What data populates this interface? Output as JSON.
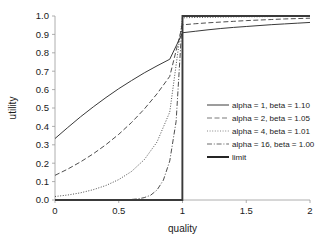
{
  "chart_data": {
    "type": "line",
    "title": "",
    "xlabel": "quality",
    "ylabel": "utility",
    "xlim": [
      0,
      2
    ],
    "ylim": [
      0,
      1
    ],
    "grid": false,
    "legend_position": "center-right",
    "xticks": [
      "0",
      "0.5",
      "1",
      "1.5",
      "2"
    ],
    "xtick_values": [
      0,
      0.5,
      1,
      1.5,
      2
    ],
    "yticks": [
      "0.0",
      "0.1",
      "0.2",
      "0.3",
      "0.4",
      "0.5",
      "0.6",
      "0.7",
      "0.8",
      "0.9",
      "1.0"
    ],
    "ytick_values": [
      0,
      0.1,
      0.2,
      0.3,
      0.4,
      0.5,
      0.6,
      0.7,
      0.8,
      0.9,
      1.0
    ],
    "series": [
      {
        "name": "alpha = 1, beta = 1.10",
        "alpha": 1,
        "beta": 1.1,
        "dash": "solid",
        "color": "#3a3a3a",
        "width": 1.0,
        "x": [
          0,
          0.1,
          0.2,
          0.3,
          0.4,
          0.5,
          0.6,
          0.7,
          0.8,
          0.9,
          1.0,
          1.1,
          1.2,
          1.3,
          1.4,
          1.5,
          1.6,
          1.7,
          1.8,
          1.9,
          2.0
        ],
        "values": [
          0.334,
          0.394,
          0.452,
          0.506,
          0.557,
          0.605,
          0.649,
          0.691,
          0.729,
          0.765,
          0.909,
          0.917,
          0.925,
          0.932,
          0.938,
          0.943,
          0.948,
          0.953,
          0.957,
          0.961,
          0.965
        ]
      },
      {
        "name": "alpha = 2, beta = 1.05",
        "alpha": 2,
        "beta": 1.05,
        "dash": "dashed",
        "color": "#6a6a6a",
        "width": 0.9,
        "x": [
          0,
          0.1,
          0.2,
          0.3,
          0.4,
          0.5,
          0.6,
          0.7,
          0.8,
          0.9,
          1.0,
          1.1,
          1.2,
          1.3,
          1.4,
          1.5,
          1.6,
          1.7,
          1.8,
          1.9,
          2.0
        ],
        "values": [
          0.134,
          0.168,
          0.207,
          0.251,
          0.301,
          0.357,
          0.421,
          0.494,
          0.577,
          0.672,
          0.952,
          0.958,
          0.963,
          0.967,
          0.971,
          0.975,
          0.978,
          0.981,
          0.984,
          0.986,
          0.988
        ]
      },
      {
        "name": "alpha = 4, beta = 1.01",
        "alpha": 4,
        "beta": 1.01,
        "dash": "dotted",
        "color": "#7a7a7a",
        "width": 0.9,
        "x": [
          0,
          0.1,
          0.2,
          0.3,
          0.4,
          0.5,
          0.6,
          0.7,
          0.8,
          0.9,
          1.0,
          1.1,
          1.2,
          1.3,
          1.4,
          1.5,
          1.6,
          1.7,
          1.8,
          1.9,
          2.0
        ],
        "values": [
          0.019,
          0.027,
          0.039,
          0.056,
          0.079,
          0.111,
          0.155,
          0.219,
          0.315,
          0.478,
          0.99,
          0.992,
          0.993,
          0.994,
          0.995,
          0.996,
          0.996,
          0.997,
          0.997,
          0.998,
          0.998
        ]
      },
      {
        "name": "alpha = 16, beta = 1.00",
        "alpha": 16,
        "beta": 1.0,
        "dash": "dashdot",
        "color": "#5a5a5a",
        "width": 0.9,
        "x": [
          0,
          0.1,
          0.2,
          0.3,
          0.4,
          0.5,
          0.6,
          0.65,
          0.7,
          0.75,
          0.8,
          0.85,
          0.9,
          0.95,
          1.0,
          1.2,
          1.5,
          1.8,
          2.0
        ],
        "values": [
          0.0,
          0.0,
          0.0,
          0.0,
          0.0,
          0.001,
          0.003,
          0.006,
          0.013,
          0.026,
          0.054,
          0.108,
          0.212,
          0.428,
          1.0,
          1.0,
          1.0,
          1.0,
          1.0
        ]
      },
      {
        "name": "limit",
        "dash": "solid",
        "color": "#1a1a1a",
        "width": 1.9,
        "x": [
          0,
          0.999,
          1.0,
          2.0
        ],
        "values": [
          0.0,
          0.0,
          1.0,
          1.0
        ]
      }
    ]
  },
  "legend": {
    "entries": [
      {
        "label": "alpha = 1, beta = 1.10"
      },
      {
        "label": "alpha = 2, beta = 1.05"
      },
      {
        "label": "alpha = 4, beta = 1.01"
      },
      {
        "label": "alpha = 16, beta = 1.00"
      },
      {
        "label": "limit"
      }
    ]
  }
}
